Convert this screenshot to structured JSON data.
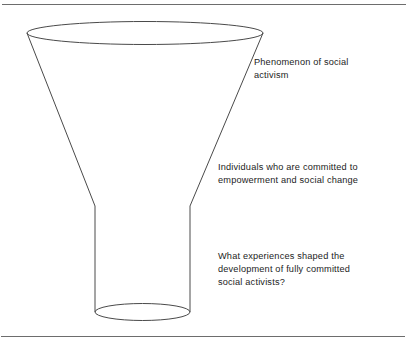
{
  "figure": {
    "name": "funnel-diagram",
    "stroke_color": "#4a4a4a",
    "rule_color": "#6d6d6d",
    "text_color": "#1c1c1c",
    "background_color": "#ffffff"
  },
  "annotations": [
    {
      "id": "phenomenon",
      "text": "Phenomenon of social\nactivism"
    },
    {
      "id": "individuals",
      "text": "Individuals who are committed to\nempowerment and social change"
    },
    {
      "id": "research-question",
      "text": "What experiences shaped the\ndevelopment of fully committed\nsocial activists?"
    }
  ],
  "shape": {
    "top_ellipse": {
      "cx": 145,
      "cy": 33,
      "rx": 118,
      "ry": 11.5
    },
    "bottom_ellipse": {
      "cx": 142.5,
      "cy": 312,
      "rx": 47.5,
      "ry": 8.5
    },
    "cone_left_top": {
      "x": 27,
      "y": 33
    },
    "cone_right_top": {
      "x": 263,
      "y": 33
    },
    "neck_left_x": 95,
    "neck_right_x": 190,
    "neck_top_y": 206,
    "neck_bottom_y": 312
  }
}
